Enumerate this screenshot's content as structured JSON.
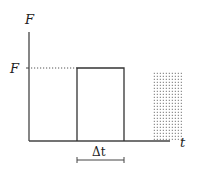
{
  "diagram": {
    "type": "force-time pulse",
    "y_axis_label": "F",
    "x_axis_label": "t",
    "level_label": "F",
    "duration_label": "Δt",
    "colors": {
      "stroke": "#333333",
      "dots": "#555555",
      "background": "#ffffff"
    },
    "elements": [
      {
        "name": "rectangular-pulse",
        "description": "Rectangular pulse of height F and width Δt"
      },
      {
        "name": "dotted-level-line",
        "description": "Dotted line from F on the axis to the pulse top"
      },
      {
        "name": "dotted-region",
        "description": "Stippled rectangular region to the right of the pulse"
      },
      {
        "name": "delta-t-bracket",
        "description": "Width bracket under pulse labeled Δt"
      }
    ]
  }
}
